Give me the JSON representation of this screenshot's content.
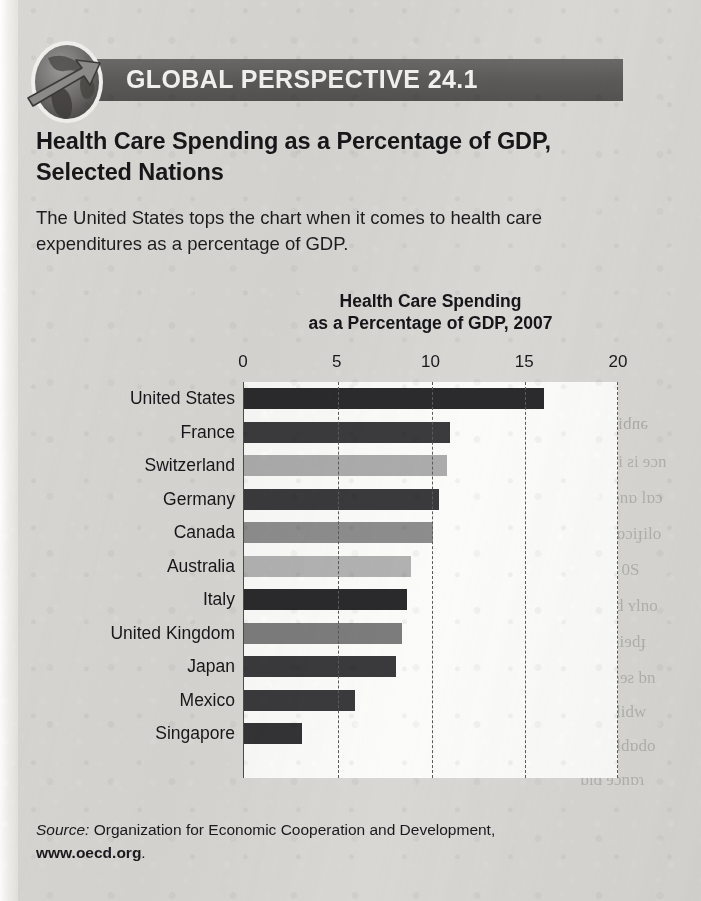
{
  "banner": {
    "label": "GLOBAL PERSPECTIVE 24.1",
    "icon": "globe-arrow-icon",
    "bar_color": "#5d5b59",
    "text_color": "#f4f3f1"
  },
  "headline": "Health Care Spending as a Percentage of GDP, Selected Nations",
  "intro": "The United States tops the chart when it comes to health care expenditures as a percentage of GDP.",
  "source": {
    "prefix": "Source:",
    "text": " Organization for Economic Cooperation and Development,",
    "url": "www.oecd.org",
    "period": "."
  },
  "chart_data": {
    "type": "bar",
    "orientation": "horizontal",
    "title": "Health Care Spending as a Percentage of GDP, 2007",
    "title_line1": "Health Care Spending",
    "title_line2": "as a Percentage of GDP, 2007",
    "xlabel": "",
    "ylabel": "",
    "xlim": [
      0,
      20
    ],
    "ticks": [
      0,
      5,
      10,
      15,
      20
    ],
    "tick_labels": [
      "0",
      "5",
      "10",
      "15",
      "20"
    ],
    "grid": true,
    "grid_style": "dashed-vertical",
    "legend": "none",
    "categories": [
      "United States",
      "France",
      "Switzerland",
      "Germany",
      "Canada",
      "Australia",
      "Italy",
      "United Kingdom",
      "Japan",
      "Mexico",
      "Singapore"
    ],
    "values": [
      16.0,
      11.0,
      10.8,
      10.4,
      10.1,
      8.9,
      8.7,
      8.4,
      8.1,
      5.9,
      3.1
    ],
    "bar_colors": [
      "#2b2b2e",
      "#3b3b3e",
      "#acacac",
      "#3a3a3d",
      "#8d8d8d",
      "#b2b2b2",
      "#2a2a2d",
      "#7c7c7c",
      "#3a3a3d",
      "#3a3a3d",
      "#333336"
    ],
    "plot_background": "#fbfbfa"
  }
}
